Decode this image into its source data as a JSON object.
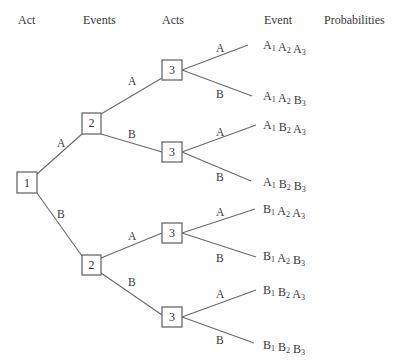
{
  "headers": {
    "act": "Act",
    "events": "Events",
    "acts": "Acts",
    "event": "Event",
    "probabilities": "Probabilities"
  },
  "nodes": [
    {
      "id": "n1",
      "label": "1"
    },
    {
      "id": "n2a",
      "label": "2"
    },
    {
      "id": "n2b",
      "label": "2"
    },
    {
      "id": "n3aa",
      "label": "3"
    },
    {
      "id": "n3ab",
      "label": "3"
    },
    {
      "id": "n3ba",
      "label": "3"
    },
    {
      "id": "n3bb",
      "label": "3"
    }
  ],
  "branch_labels": {
    "n1_a": "A",
    "n1_b": "B",
    "n2a_a": "A",
    "n2a_b": "B",
    "n2b_a": "A",
    "n2b_b": "B",
    "n3aa_a": "A",
    "n3aa_b": "B",
    "n3ab_a": "A",
    "n3ab_b": "B",
    "n3ba_a": "A",
    "n3ba_b": "B",
    "n3bb_a": "A",
    "n3bb_b": "B"
  },
  "outcomes": [
    {
      "terms": [
        {
          "l": "A",
          "s": "1"
        },
        {
          "l": "A",
          "s": "2"
        },
        {
          "l": "A",
          "s": "3"
        }
      ]
    },
    {
      "terms": [
        {
          "l": "A",
          "s": "1"
        },
        {
          "l": "A",
          "s": "2"
        },
        {
          "l": "B",
          "s": "3"
        }
      ]
    },
    {
      "terms": [
        {
          "l": "A",
          "s": "1"
        },
        {
          "l": "B",
          "s": "2"
        },
        {
          "l": "A",
          "s": "3"
        }
      ]
    },
    {
      "terms": [
        {
          "l": "A",
          "s": "1"
        },
        {
          "l": "B",
          "s": "2"
        },
        {
          "l": "B",
          "s": "3"
        }
      ]
    },
    {
      "terms": [
        {
          "l": "B",
          "s": "1"
        },
        {
          "l": "A",
          "s": "2"
        },
        {
          "l": "A",
          "s": "3"
        }
      ]
    },
    {
      "terms": [
        {
          "l": "B",
          "s": "1"
        },
        {
          "l": "A",
          "s": "2"
        },
        {
          "l": "B",
          "s": "3"
        }
      ]
    },
    {
      "terms": [
        {
          "l": "B",
          "s": "1"
        },
        {
          "l": "B",
          "s": "2"
        },
        {
          "l": "A",
          "s": "3"
        }
      ]
    },
    {
      "terms": [
        {
          "l": "B",
          "s": "1"
        },
        {
          "l": "B",
          "s": "2"
        },
        {
          "l": "B",
          "s": "3"
        }
      ]
    }
  ]
}
